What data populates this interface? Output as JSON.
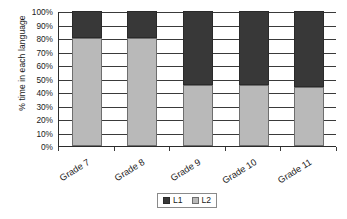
{
  "chart_data": {
    "type": "bar",
    "subtype": "stacked-100-percent",
    "title": "",
    "subtitle": "",
    "xlabel": "",
    "ylabel": "% time in each language",
    "categories": [
      "Grade 7",
      "Grade 8",
      "Grade 9",
      "Grade 10",
      "Grade 11"
    ],
    "series": [
      {
        "name": "L1",
        "color": "#383838",
        "values": [
          20,
          20,
          55,
          55,
          56
        ]
      },
      {
        "name": "L2",
        "color": "#b9b9b9",
        "values": [
          80,
          80,
          45,
          45,
          44
        ]
      }
    ],
    "stack_order": [
      "L2",
      "L1"
    ],
    "ylim": [
      0,
      100
    ],
    "y_tick_values": [
      0,
      10,
      20,
      30,
      40,
      50,
      60,
      70,
      80,
      90,
      100
    ],
    "y_tick_labels": [
      "0%",
      "10%",
      "20%",
      "30%",
      "40%",
      "50%",
      "60%",
      "70%",
      "80%",
      "90%",
      "100%"
    ],
    "grid": "horizontal",
    "legend_position": "bottom-center",
    "legend_entries": [
      "L1",
      "L2"
    ]
  },
  "axes": {
    "y_title": "% time in each language",
    "y_ticks": [
      "0%",
      "10%",
      "20%",
      "30%",
      "40%",
      "50%",
      "60%",
      "70%",
      "80%",
      "90%",
      "100%"
    ],
    "x_ticks": [
      "Grade 7",
      "Grade 8",
      "Grade 9",
      "Grade 10",
      "Grade 11"
    ]
  },
  "legend": {
    "items": [
      {
        "label": "L1",
        "color": "#383838"
      },
      {
        "label": "L2",
        "color": "#b9b9b9"
      }
    ]
  },
  "colors": {
    "l1": "#383838",
    "l2": "#b9b9b9",
    "axis": "#2b2b2b",
    "gridline": "#3a3a3a",
    "background": "#ffffff",
    "text": "#1a1a1a"
  }
}
